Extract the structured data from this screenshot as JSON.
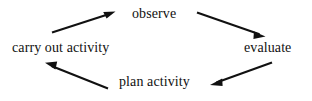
{
  "diagram": {
    "type": "cycle",
    "title": "",
    "background_color": "#ffffff",
    "line_color": "#111111",
    "text_color": "#111111",
    "nodes": [
      {
        "id": "observe",
        "label": "observe",
        "position": "top-center"
      },
      {
        "id": "evaluate",
        "label": "evaluate",
        "position": "right"
      },
      {
        "id": "plan-activity",
        "label": "plan activity",
        "position": "bottom-center"
      },
      {
        "id": "carry-out-activity",
        "label": "carry out activity",
        "position": "left"
      }
    ],
    "edges": [
      {
        "id": "observe-to-evaluate",
        "from": "observe",
        "to": "evaluate",
        "arrowhead": "end",
        "direction": "down-right"
      },
      {
        "id": "evaluate-to-plan-activity",
        "from": "evaluate",
        "to": "plan-activity",
        "arrowhead": "end",
        "direction": "down-left"
      },
      {
        "id": "plan-activity-to-carry-out-activity",
        "from": "plan-activity",
        "to": "carry-out-activity",
        "arrowhead": "end",
        "direction": "up-left"
      },
      {
        "id": "carry-out-activity-to-observe",
        "from": "carry-out-activity",
        "to": "observe",
        "arrowhead": "end",
        "direction": "up-right"
      }
    ]
  }
}
